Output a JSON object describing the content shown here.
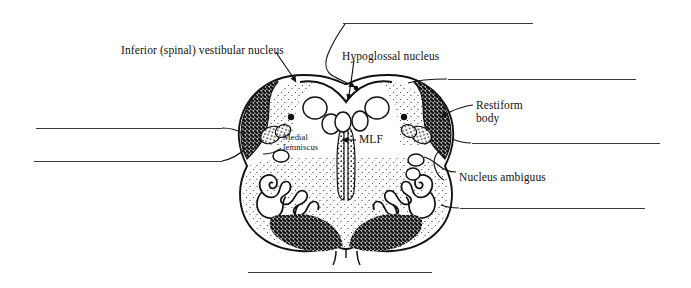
{
  "figure": {
    "background_color": "#ffffff",
    "ink_color": "#111111",
    "rule_color": "#3a3a3a"
  },
  "labels": [
    {
      "id": "inferior-spinal-vestibular-nucleus",
      "text": "Inferior (spinal) vestibular nucleus",
      "x": 121,
      "y": 44,
      "size": "normal"
    },
    {
      "id": "hypoglossal-nucleus",
      "text": "Hypoglossal nucleus",
      "x": 342,
      "y": 50,
      "size": "normal"
    },
    {
      "id": "restiform-body-line1",
      "text": "Restiform",
      "x": 476,
      "y": 99,
      "size": "normal"
    },
    {
      "id": "restiform-body-line2",
      "text": "body",
      "x": 476,
      "y": 112,
      "size": "normal"
    },
    {
      "id": "medial-lemniscus-line1",
      "text": "Medial",
      "x": 283,
      "y": 133,
      "size": "small"
    },
    {
      "id": "medial-lemniscus-line2",
      "text": "lemniscus",
      "x": 283,
      "y": 143,
      "size": "small"
    },
    {
      "id": "mlf",
      "text": "MLF",
      "x": 359,
      "y": 139,
      "size": "normal"
    },
    {
      "id": "nucleus-ambiguus",
      "text": "Nucleus ambiguus",
      "x": 459,
      "y": 171,
      "size": "normal"
    }
  ],
  "answer_blanks": [
    {
      "id": "blank-top",
      "position": "top",
      "x": 343,
      "y": 23,
      "width": 190
    },
    {
      "id": "blank-right-1",
      "position": "upper-right",
      "x": 448,
      "y": 79,
      "width": 188
    },
    {
      "id": "blank-right-2",
      "position": "middle-right",
      "x": 472,
      "y": 143,
      "width": 188
    },
    {
      "id": "blank-right-3",
      "position": "lower-right",
      "x": 460,
      "y": 208,
      "width": 185
    },
    {
      "id": "blank-left-1",
      "position": "upper-left",
      "x": 36,
      "y": 128,
      "width": 186
    },
    {
      "id": "blank-left-2",
      "position": "lower-left",
      "x": 34,
      "y": 161,
      "width": 188
    },
    {
      "id": "blank-bottom",
      "position": "bottom",
      "x": 248,
      "y": 272,
      "width": 184
    }
  ],
  "anatomy": {
    "regions": [
      {
        "id": "restiform-body-left",
        "shading": "dark-stipple"
      },
      {
        "id": "restiform-body-right",
        "shading": "dark-stipple"
      },
      {
        "id": "vestibular-nucleus-left",
        "shading": "light-stipple"
      },
      {
        "id": "vestibular-nucleus-right",
        "shading": "light-stipple"
      },
      {
        "id": "tegmentum",
        "shading": "light-stipple"
      },
      {
        "id": "pyramid-left",
        "shading": "dark-stipple"
      },
      {
        "id": "pyramid-right",
        "shading": "dark-stipple"
      },
      {
        "id": "inferior-olivary-nucleus-left",
        "shading": "outline-wavy"
      },
      {
        "id": "inferior-olivary-nucleus-right",
        "shading": "outline-wavy"
      },
      {
        "id": "mlf-column-left",
        "shading": "vertical-stipple"
      },
      {
        "id": "mlf-column-right",
        "shading": "vertical-stipple"
      },
      {
        "id": "medial-lemniscus-left",
        "shading": "mid-stipple"
      },
      {
        "id": "medial-lemniscus-right",
        "shading": "mid-stipple"
      }
    ]
  }
}
